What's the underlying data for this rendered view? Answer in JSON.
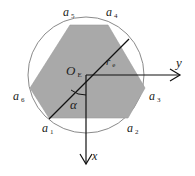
{
  "diagram": {
    "colors": {
      "hexagon_fill": "#a9a9a9",
      "circle_stroke": "#8a8a8a",
      "line": "#111111",
      "background": "#ffffff"
    },
    "circle": {
      "cx": 86,
      "cy": 75,
      "r": 58
    },
    "hexagon_points": "70,25 108,25 145,88 128,118 49,118 30,88",
    "labels": {
      "a1": {
        "base": "a",
        "sub": "1"
      },
      "a2": {
        "base": "a",
        "sub": "2"
      },
      "a3": {
        "base": "a",
        "sub": "3"
      },
      "a4": {
        "base": "a",
        "sub": "4"
      },
      "a5": {
        "base": "a",
        "sub": "5"
      },
      "a6": {
        "base": "a",
        "sub": "6"
      },
      "origin": {
        "base": "O",
        "sub": "E"
      },
      "radius": {
        "base": "r",
        "sub": "e"
      },
      "angle": "α",
      "x_axis": "x",
      "y_axis": "y"
    }
  }
}
